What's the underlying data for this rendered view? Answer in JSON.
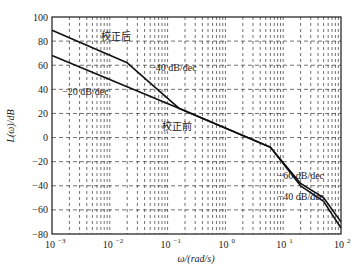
{
  "chart_data": {
    "type": "line",
    "title": "",
    "xlabel": "ω/(rad/s)",
    "ylabel": "L(ω)/dB",
    "xscale": "log",
    "xlim": [
      0.001,
      100
    ],
    "ylim": [
      -80,
      100
    ],
    "grid": true,
    "x_ticks": [
      0.001,
      0.01,
      0.1,
      1,
      10,
      100
    ],
    "x_tick_labels": [
      {
        "base": "10",
        "exp": "−3"
      },
      {
        "base": "10",
        "exp": "−2"
      },
      {
        "base": "10",
        "exp": "−1"
      },
      {
        "base": "10",
        "exp": "0"
      },
      {
        "base": "10",
        "exp": "1"
      },
      {
        "base": "10",
        "exp": "2"
      }
    ],
    "y_ticks": [
      100,
      80,
      60,
      40,
      20,
      0,
      -20,
      -40,
      -60,
      -80
    ],
    "y_tick_labels": [
      "100",
      "80",
      "60",
      "40",
      "20",
      "0",
      "−20",
      "−40",
      "−60",
      "−80"
    ],
    "series": [
      {
        "name": "校正后",
        "x": [
          0.001,
          0.02,
          0.16,
          6,
          20,
          50,
          100
        ],
        "y": [
          89,
          62,
          24,
          -8,
          -38,
          -50,
          -70
        ]
      },
      {
        "name": "校正前",
        "x": [
          0.001,
          0.16,
          6,
          20,
          50,
          100
        ],
        "y": [
          68,
          24,
          -8,
          -40,
          -53,
          -75
        ]
      }
    ],
    "annotations": [
      {
        "text": "校正后",
        "x": 0.007,
        "y": 81
      },
      {
        "text": "−40 dB/dec",
        "x": 0.05,
        "y": 55
      },
      {
        "text": "−20 dB/dec",
        "x": 0.0015,
        "y": 35
      },
      {
        "text": "校正前",
        "x": 0.08,
        "y": 6
      },
      {
        "text": "−60 dB/dec",
        "x": 8,
        "y": -34
      },
      {
        "text": "−40 dB/dec",
        "x": 8,
        "y": -52
      }
    ]
  }
}
